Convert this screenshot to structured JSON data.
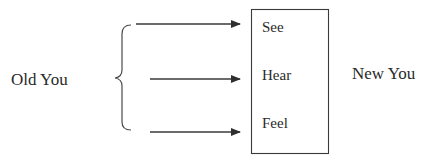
{
  "diagram": {
    "left_label": "Old You",
    "right_label": "New You",
    "box_items": [
      "See",
      "Hear",
      "Feel"
    ],
    "arrow_count": 3,
    "colors": {
      "stroke": "#3a3a3a",
      "text": "#2a2a2a",
      "background": "#ffffff"
    }
  }
}
